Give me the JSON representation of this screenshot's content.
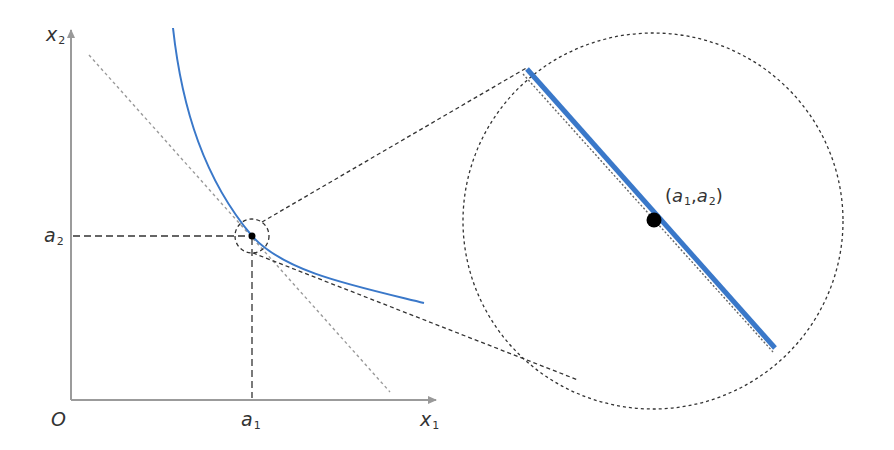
{
  "diagram": {
    "type": "tangent-line-zoom",
    "axes": {
      "x_label": {
        "base": "x",
        "sub": "1"
      },
      "y_label": {
        "base": "x",
        "sub": "2"
      },
      "origin_label": "O"
    },
    "ticks": {
      "a1": {
        "base": "a",
        "sub": "1"
      },
      "a2": {
        "base": "a",
        "sub": "2"
      }
    },
    "point_label": {
      "open": "(",
      "a1_base": "a",
      "a1_sub": "1",
      "sep": ",",
      "a2_base": "a",
      "a2_sub": "2",
      "close": ")"
    },
    "colors": {
      "curve": "#3a78c9",
      "axis": "#999999",
      "tangent": "#9a9a9a",
      "dashed": "#333333",
      "point": "#000000",
      "text": "#333333"
    }
  }
}
